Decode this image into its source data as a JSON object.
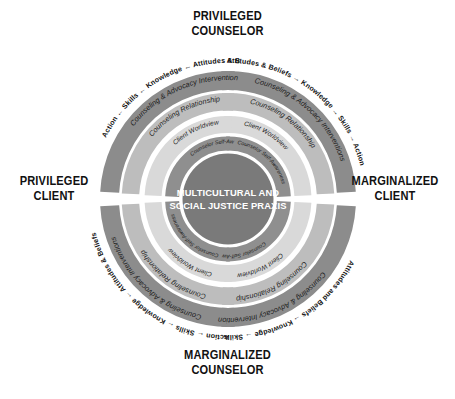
{
  "figure": {
    "title_hidden": "Multicultural and Social Justice Counseling Competencies",
    "core": {
      "line1": "MULTICULTURAL AND",
      "line2": "SOCIAL JUSTICE PRAXIS"
    },
    "cardinal_labels": {
      "top": {
        "line1": "PRIVILEGED",
        "line2": "COUNSELOR"
      },
      "bottom": {
        "line1": "MARGINALIZED",
        "line2": "COUNSELOR"
      },
      "left": {
        "line1": "PRIVILEGED",
        "line2": "CLIENT"
      },
      "right": {
        "line1": "MARGINALIZED",
        "line2": "CLIENT"
      }
    },
    "rings": [
      {
        "id": "counselor-self-awareness",
        "label": "Counselor Self-Awareness",
        "order": 1,
        "color": "#8f8f8f",
        "text_size": 5.4
      },
      {
        "id": "client-worldview",
        "label": "Client Worldview",
        "order": 2,
        "color": "#d9d9d9",
        "text_size": 6.6
      },
      {
        "id": "counseling-relationship",
        "label": "Counseling Relationship",
        "order": 3,
        "color": "#bdbdbd",
        "text_size": 7.3
      },
      {
        "id": "counseling-advocacy-interventions",
        "label": "Counseling & Advocacy Interventions",
        "order": 4,
        "color": "#8c8c8c",
        "text_size": 7.4
      }
    ],
    "developmental_domains": {
      "forward": "Attitudes & Beliefs → Knowledge → Skills → Action",
      "reverse": "Action ← Skills ← Knowledge ← Attitudes & Beliefs",
      "bottom_right": "Attitudes and Beliefs → Knowledge → Skills → Action",
      "bottom_left": "Action ← Skills ← Knowledge ← Attitudes & Beliefs",
      "items": [
        "Attitudes & Beliefs",
        "Knowledge",
        "Skills",
        "Action"
      ]
    },
    "colors": {
      "core_circle": "#7a7a7a",
      "ring_dark": "#8c8c8c",
      "ring_mid": "#bdbdbd",
      "ring_light": "#d9d9d9",
      "ring_inner": "#8f8f8f",
      "background": "#ffffff",
      "text_dark": "#111111",
      "text_light": "#ffffff"
    },
    "geometry": {
      "center_x": 228,
      "center_y": 199,
      "core_radius": 45,
      "outer_radius": 127
    }
  }
}
